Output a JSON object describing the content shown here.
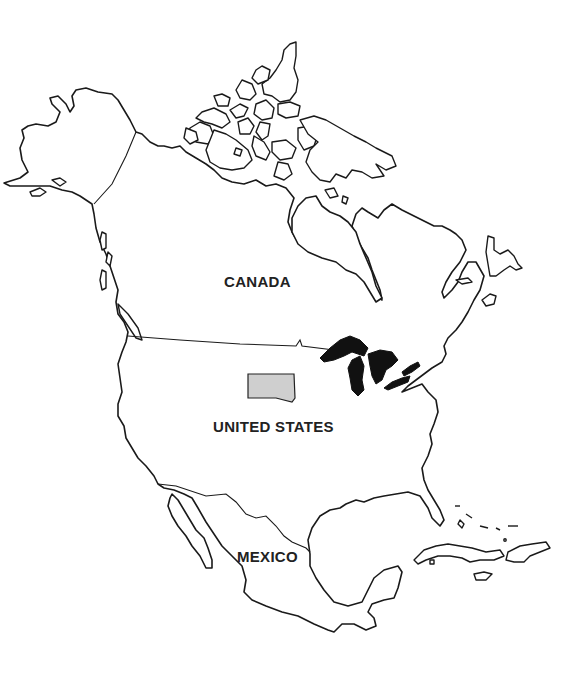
{
  "map": {
    "title": "North America",
    "colors": {
      "background": "#ffffff",
      "outline": "#1a1a1a",
      "lakes": "#111111",
      "highlighted_state": "#cfcfcf"
    },
    "labels": {
      "canada": "CANADA",
      "united_states": "UNITED STATES",
      "mexico": "MEXICO"
    },
    "features": {
      "highlighted_state": "South Dakota (shaded)",
      "water_bodies": "Great Lakes (filled black)"
    }
  }
}
